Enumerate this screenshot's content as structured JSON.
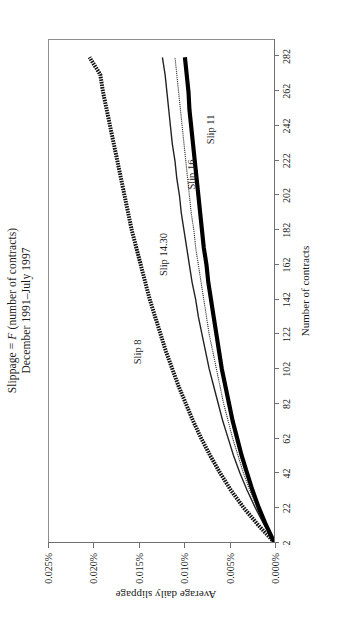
{
  "figure": {
    "title_line1": "Slippage = F (number of contracts)",
    "title_line1_plain": "Slippage = ",
    "title_line1_italic": "F",
    "title_line1_rest": " (number of contracts)",
    "title_line2": "December 1991–July 1997"
  },
  "chart_data": {
    "type": "line",
    "title": "Slippage = F (number of contracts)",
    "subtitle": "December 1991–July 1997",
    "xlabel": "Number of contracts",
    "ylabel": "Average daily slippage",
    "xlim": [
      2,
      292
    ],
    "ylim": [
      0.0,
      0.025
    ],
    "grid": false,
    "legend": "inline-annotations",
    "xticklabels": [
      "2",
      "22",
      "42",
      "62",
      "82",
      "102",
      "122",
      "142",
      "162",
      "182",
      "202",
      "222",
      "242",
      "262",
      "282"
    ],
    "xtickvalues": [
      2,
      22,
      42,
      62,
      82,
      102,
      122,
      142,
      162,
      182,
      202,
      222,
      242,
      262,
      282
    ],
    "yticklabels": [
      "0.000%",
      "0.005%",
      "0.010%",
      "0.015%",
      "0.020%",
      "0.025%"
    ],
    "ytickvalues": [
      0.0,
      0.005,
      0.01,
      0.015,
      0.02,
      0.025
    ],
    "x": [
      2,
      12,
      22,
      32,
      42,
      52,
      62,
      72,
      82,
      92,
      102,
      112,
      122,
      132,
      142,
      152,
      162,
      172,
      182,
      192,
      202,
      212,
      222,
      232,
      242,
      252,
      262,
      272,
      282
    ],
    "series": [
      {
        "name": "Slip 8",
        "style": "thick-dotted",
        "color": "#111111",
        "label_x": 112,
        "label_y": 0.0152,
        "values": [
          0.0,
          0.0018,
          0.0034,
          0.0048,
          0.006,
          0.0071,
          0.0081,
          0.009,
          0.0098,
          0.0106,
          0.0113,
          0.012,
          0.0126,
          0.0132,
          0.0138,
          0.0143,
          0.0148,
          0.0153,
          0.0158,
          0.0162,
          0.0166,
          0.017,
          0.0174,
          0.0178,
          0.0182,
          0.0186,
          0.019,
          0.0193,
          0.0205
        ]
      },
      {
        "name": "Slip 14.30",
        "style": "thin-solid",
        "color": "#222222",
        "label_x": 168,
        "label_y": 0.0123,
        "values": [
          0.0,
          0.0011,
          0.0021,
          0.003,
          0.0038,
          0.0045,
          0.0051,
          0.0057,
          0.0062,
          0.0067,
          0.0072,
          0.0076,
          0.008,
          0.0084,
          0.0087,
          0.0091,
          0.0094,
          0.0097,
          0.01,
          0.0103,
          0.0105,
          0.0108,
          0.011,
          0.0113,
          0.0115,
          0.0117,
          0.0119,
          0.0121,
          0.0124
        ]
      },
      {
        "name": "Slip 16",
        "style": "hairline-dotted",
        "color": "#333333",
        "label_x": 214,
        "label_y": 0.0092,
        "values": [
          0.0,
          0.001,
          0.0019,
          0.0027,
          0.0034,
          0.004,
          0.0046,
          0.0051,
          0.0056,
          0.006,
          0.0064,
          0.0068,
          0.0072,
          0.0075,
          0.0078,
          0.0081,
          0.0084,
          0.0087,
          0.0089,
          0.0092,
          0.0094,
          0.0096,
          0.0098,
          0.01,
          0.0102,
          0.0104,
          0.0106,
          0.0108,
          0.011
        ]
      },
      {
        "name": "Slip 11",
        "style": "very-thick-solid",
        "color": "#000000",
        "label_x": 240,
        "label_y": 0.0072,
        "values": [
          0.0,
          0.0009,
          0.0017,
          0.0024,
          0.003,
          0.0036,
          0.0041,
          0.0046,
          0.005,
          0.0054,
          0.0058,
          0.0061,
          0.0064,
          0.0067,
          0.007,
          0.0073,
          0.0075,
          0.0078,
          0.008,
          0.0082,
          0.0084,
          0.0086,
          0.0088,
          0.009,
          0.0092,
          0.0094,
          0.0095,
          0.0097,
          0.0099
        ]
      }
    ]
  }
}
